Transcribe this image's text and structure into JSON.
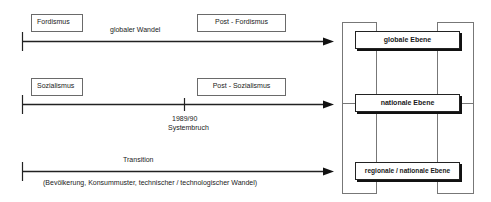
{
  "rows": [
    {
      "id": "global",
      "start_box": "Fordismus",
      "end_box": "Post - Fordismus",
      "above_label": "globaler Wandel"
    },
    {
      "id": "national",
      "start_box": "Sozialismus",
      "end_box": "Post - Sozialismus",
      "milestone": {
        "year": "1989/90",
        "label": "Systembruch"
      }
    },
    {
      "id": "regional",
      "above_label": "Transition",
      "below_label": "(Bevölkerung, Konsummuster, technischer / technologischer Wandel)"
    }
  ],
  "levels": [
    {
      "label": "globale Ebene"
    },
    {
      "label": "nationale Ebene"
    },
    {
      "label": "regionale / nationale Ebene"
    }
  ],
  "colors": {
    "line": "#222222",
    "frame": "#777777",
    "box_border": "#6a6a6a"
  }
}
